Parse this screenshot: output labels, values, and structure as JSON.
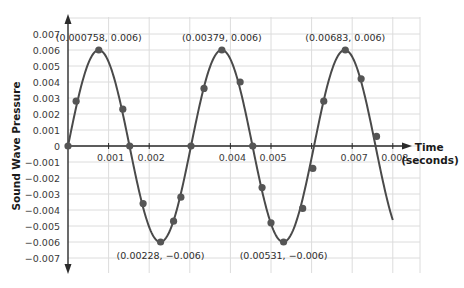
{
  "chart_data": {
    "type": "line",
    "title": "",
    "xlabel": "Time (seconds)",
    "xlabel_lines": [
      "Time",
      "(seconds)"
    ],
    "ylabel": "Sound Wave Pressure",
    "xlim": [
      0,
      0.0086
    ],
    "ylim": [
      -0.0078,
      0.0078
    ],
    "grid": true,
    "legend": "none",
    "x_ticks": [
      {
        "value": 0.001,
        "label": "0.001"
      },
      {
        "value": 0.002,
        "label": "0.002"
      },
      {
        "value": 0.004,
        "label": "0.004"
      },
      {
        "value": 0.005,
        "label": "0.005"
      },
      {
        "value": 0.007,
        "label": "0.007"
      },
      {
        "value": 0.008,
        "label": "0.008"
      }
    ],
    "y_ticks": [
      {
        "value": 0.007,
        "label": "0.007"
      },
      {
        "value": 0.006,
        "label": "0.006"
      },
      {
        "value": 0.005,
        "label": "0.005"
      },
      {
        "value": 0.004,
        "label": "0.004"
      },
      {
        "value": 0.003,
        "label": "0.003"
      },
      {
        "value": 0.002,
        "label": "0.002"
      },
      {
        "value": 0.001,
        "label": "0.001"
      },
      {
        "value": 0,
        "label": "0"
      },
      {
        "value": -0.001,
        "label": "−0.001"
      },
      {
        "value": -0.002,
        "label": "−0.002"
      },
      {
        "value": -0.003,
        "label": "−0.003"
      },
      {
        "value": -0.004,
        "label": "−0.004"
      },
      {
        "value": -0.005,
        "label": "−0.005"
      },
      {
        "value": -0.006,
        "label": "−0.006"
      },
      {
        "value": -0.007,
        "label": "−0.007"
      }
    ],
    "curve": {
      "function": "0.006 * sin(2*pi*t/0.00303)",
      "amplitude": 0.006,
      "period": 0.00303,
      "t_end": 0.008
    },
    "series": [
      {
        "name": "Sound wave",
        "color": "#4a4a4a",
        "points": [
          {
            "x": 0,
            "y": 0
          },
          {
            "x": 0.0002,
            "y": 0.0028
          },
          {
            "x": 0.000758,
            "y": 0.006
          },
          {
            "x": 0.00135,
            "y": 0.0023
          },
          {
            "x": 0.00152,
            "y": 0
          },
          {
            "x": 0.00185,
            "y": -0.0036
          },
          {
            "x": 0.00228,
            "y": -0.006
          },
          {
            "x": 0.0026,
            "y": -0.0047
          },
          {
            "x": 0.00278,
            "y": -0.0032
          },
          {
            "x": 0.00303,
            "y": 0
          },
          {
            "x": 0.00335,
            "y": 0.0036
          },
          {
            "x": 0.00379,
            "y": 0.006
          },
          {
            "x": 0.00424,
            "y": 0.004
          },
          {
            "x": 0.00455,
            "y": 0
          },
          {
            "x": 0.00478,
            "y": -0.0026
          },
          {
            "x": 0.005,
            "y": -0.0048
          },
          {
            "x": 0.00531,
            "y": -0.006
          },
          {
            "x": 0.00578,
            "y": -0.0039
          },
          {
            "x": 0.00603,
            "y": -0.0014
          },
          {
            "x": 0.0063,
            "y": 0.0028
          },
          {
            "x": 0.00683,
            "y": 0.006
          },
          {
            "x": 0.00722,
            "y": 0.0042
          },
          {
            "x": 0.0076,
            "y": 0.0006
          }
        ]
      }
    ],
    "annotations": [
      {
        "text": "(0.000758, 0.006)",
        "x": 0.000758,
        "y": 0.006,
        "position": "above"
      },
      {
        "text": "(0.00379, 0.006)",
        "x": 0.00379,
        "y": 0.006,
        "position": "above"
      },
      {
        "text": "(0.00683, 0.006)",
        "x": 0.00683,
        "y": 0.006,
        "position": "above"
      },
      {
        "text": "(0.00228, −0.006)",
        "x": 0.00228,
        "y": -0.006,
        "position": "below"
      },
      {
        "text": "(0.00531, −0.006)",
        "x": 0.00531,
        "y": -0.006,
        "position": "below"
      }
    ]
  },
  "style": {
    "curve_color": "#4a4a4a",
    "axis_color": "#2b2b2b",
    "grid_color": "#dcdcdc",
    "point_color": "#555555"
  }
}
